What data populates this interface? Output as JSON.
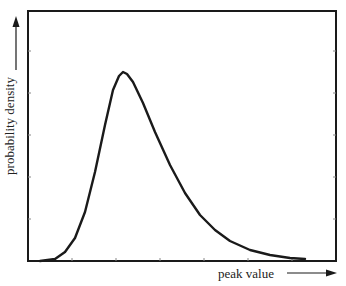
{
  "chart_data": {
    "type": "line",
    "title": "",
    "xlabel": "peak value",
    "ylabel": "probability density",
    "grid": false,
    "legend": null,
    "x_ticks": 6,
    "y_ticks": 5,
    "tick_labels": false,
    "frame": {
      "left": 28,
      "top": 11,
      "right": 336,
      "bottom": 261
    },
    "x_tick_px": [
      72,
      116,
      160,
      204,
      248,
      292
    ],
    "y_tick_px": [
      51,
      93,
      135,
      177,
      219
    ],
    "points_px": [
      [
        40,
        261
      ],
      [
        55,
        259
      ],
      [
        65,
        252
      ],
      [
        75,
        238
      ],
      [
        85,
        212
      ],
      [
        95,
        172
      ],
      [
        105,
        125
      ],
      [
        113,
        90
      ],
      [
        119,
        76
      ],
      [
        123,
        72
      ],
      [
        127,
        74
      ],
      [
        133,
        82
      ],
      [
        143,
        103
      ],
      [
        155,
        132
      ],
      [
        170,
        165
      ],
      [
        185,
        193
      ],
      [
        200,
        215
      ],
      [
        215,
        230
      ],
      [
        230,
        241
      ],
      [
        250,
        250
      ],
      [
        270,
        255
      ],
      [
        290,
        258
      ],
      [
        305,
        259
      ]
    ],
    "x_normalized": [
      0.04,
      0.09,
      0.12,
      0.15,
      0.19,
      0.22,
      0.25,
      0.28,
      0.3,
      0.31,
      0.32,
      0.34,
      0.37,
      0.41,
      0.46,
      0.51,
      0.56,
      0.6,
      0.65,
      0.72,
      0.78,
      0.85,
      0.9
    ],
    "y_normalized": [
      0.0,
      0.01,
      0.04,
      0.09,
      0.2,
      0.36,
      0.54,
      0.68,
      0.74,
      0.76,
      0.75,
      0.72,
      0.63,
      0.52,
      0.38,
      0.27,
      0.18,
      0.12,
      0.08,
      0.04,
      0.02,
      0.01,
      0.01
    ],
    "peak": {
      "x_normalized": 0.31,
      "y_normalized": 0.76
    }
  },
  "labels": {
    "x_axis": "peak value",
    "y_axis": "probability density"
  },
  "colors": {
    "line": "#1a1a1a",
    "frame": "#1a1a1a",
    "background": "#ffffff"
  }
}
